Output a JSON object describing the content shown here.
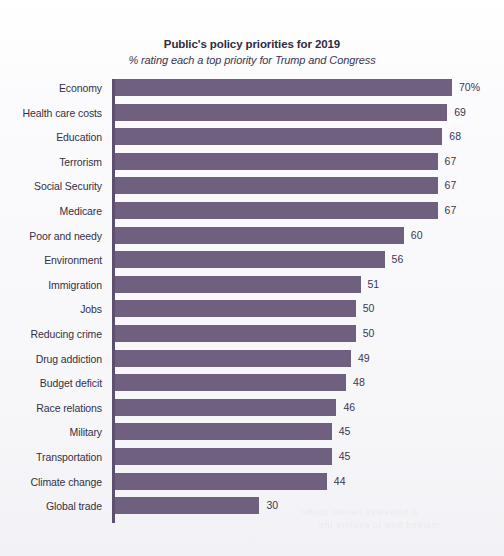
{
  "chart_data": {
    "type": "bar",
    "orientation": "horizontal",
    "title": "Public's policy priorities for 2019",
    "subtitle": "% rating each a top priority for Trump and Congress",
    "xlabel": "",
    "ylabel": "",
    "xlim": [
      0,
      70
    ],
    "grid": false,
    "legend": null,
    "bar_color": "#6f6080",
    "axis_color": "#5d4f6e",
    "categories": [
      "Economy",
      "Health care costs",
      "Education",
      "Terrorism",
      "Social Security",
      "Medicare",
      "Poor and needy",
      "Environment",
      "Immigration",
      "Jobs",
      "Reducing crime",
      "Drug addiction",
      "Budget deficit",
      "Race relations",
      "Military",
      "Transportation",
      "Climate change",
      "Global trade"
    ],
    "values": [
      70,
      69,
      68,
      67,
      67,
      67,
      60,
      56,
      51,
      50,
      50,
      49,
      48,
      46,
      45,
      45,
      44,
      30
    ],
    "value_labels": [
      "70%",
      "69",
      "68",
      "67",
      "67",
      "67",
      "60",
      "56",
      "51",
      "50",
      "50",
      "49",
      "48",
      "46",
      "45",
      "45",
      "44",
      "30"
    ]
  },
  "artifacts": {
    "bleed_line_1": "a noiseless patient spider",
    "bleed_line_2": "marked how to explore the"
  }
}
